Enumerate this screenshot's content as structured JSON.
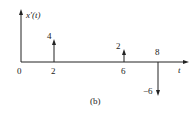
{
  "figure": {
    "caption": "(b)",
    "y_axis_label": "x′(t)",
    "x_axis_label": "t",
    "origin_label": "0"
  },
  "impulses": [
    {
      "t": 2,
      "t_label": "2",
      "weight": 4,
      "weight_label": "4",
      "direction": "up"
    },
    {
      "t": 6,
      "t_label": "6",
      "weight": 2,
      "weight_label": "2",
      "direction": "up"
    },
    {
      "t": 8,
      "t_label": "8",
      "weight": -6,
      "weight_label": "−6",
      "direction": "down"
    }
  ],
  "colors": {
    "ink": "#222222",
    "background": "#ffffff"
  }
}
